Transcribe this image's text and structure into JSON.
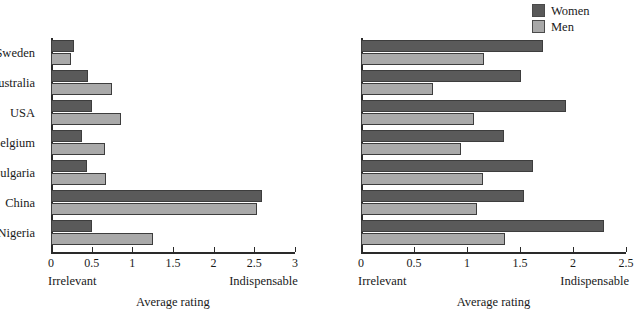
{
  "legend": {
    "position": "top-right",
    "entries": [
      {
        "label": "Women",
        "color": "#5a5a5a",
        "icon": "legend-swatch-women"
      },
      {
        "label": "Men",
        "color": "#a9a9a9",
        "icon": "legend-swatch-men"
      }
    ]
  },
  "chart_data": [
    {
      "id": "left",
      "type": "bar",
      "orientation": "horizontal",
      "title": "",
      "xlabel": "Average rating",
      "ylabel": "",
      "xlim": [
        0,
        3
      ],
      "xticks": [
        "0",
        "0.5",
        "1",
        "1.5",
        "2",
        "2.5",
        "3"
      ],
      "xtick_values": [
        0,
        0.5,
        1,
        1.5,
        2,
        2.5,
        3
      ],
      "grid": false,
      "axis_low_label": "Irrelevant",
      "axis_high_label": "Indispensable",
      "categories": [
        "Sweden",
        "Australia",
        "USA",
        "Belgium",
        "Bulgaria",
        "China",
        "Nigeria"
      ],
      "series": [
        {
          "name": "Women",
          "color": "#5a5a5a",
          "values": [
            0.28,
            0.45,
            0.5,
            0.38,
            0.44,
            2.6,
            0.5
          ]
        },
        {
          "name": "Men",
          "color": "#a9a9a9",
          "values": [
            0.25,
            0.75,
            0.86,
            0.67,
            0.68,
            2.53,
            1.25
          ]
        }
      ]
    },
    {
      "id": "right",
      "type": "bar",
      "orientation": "horizontal",
      "title": "",
      "xlabel": "Average rating",
      "ylabel": "",
      "xlim": [
        0,
        2.5
      ],
      "xticks": [
        "0",
        "0.5",
        "1",
        "1.5",
        "2",
        "2.5"
      ],
      "xtick_values": [
        0,
        0.5,
        1,
        1.5,
        2,
        2.5
      ],
      "grid": false,
      "axis_low_label": "Irrelevant",
      "axis_high_label": "Indispensable",
      "categories": [
        "Sweden",
        "Australia",
        "USA",
        "Belgium",
        "Bulgaria",
        "China",
        "Nigeria"
      ],
      "series": [
        {
          "name": "Women",
          "color": "#5a5a5a",
          "values": [
            1.72,
            1.51,
            1.93,
            1.35,
            1.62,
            1.54,
            2.29
          ]
        },
        {
          "name": "Men",
          "color": "#a9a9a9",
          "values": [
            1.16,
            0.68,
            1.07,
            0.94,
            1.15,
            1.09,
            1.36
          ]
        }
      ]
    }
  ]
}
